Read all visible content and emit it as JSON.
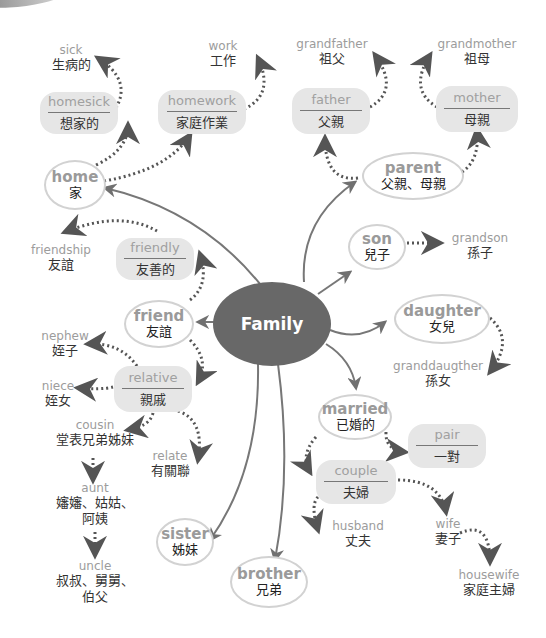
{
  "title": "Family",
  "center": {
    "label": "Family"
  },
  "colors": {
    "center_fill": "#686868",
    "box_fill": "#e6e6e6",
    "english_text": "#9c9c9c",
    "chinese_text": "#333333",
    "arrow": "#707070"
  },
  "nodes": {
    "home": {
      "en": "home",
      "zh": "家"
    },
    "homesick": {
      "en": "homesick",
      "zh": "想家的"
    },
    "sick": {
      "en": "sick",
      "zh": "生病的"
    },
    "homework": {
      "en": "homework",
      "zh": "家庭作業"
    },
    "work": {
      "en": "work",
      "zh": "工作"
    },
    "parent": {
      "en": "parent",
      "zh": "父親、母親"
    },
    "father": {
      "en": "father",
      "zh": "父親"
    },
    "grandfather": {
      "en": "grandfather",
      "zh": "祖父"
    },
    "mother": {
      "en": "mother",
      "zh": "母親"
    },
    "grandmother": {
      "en": "grandmother",
      "zh": "祖母"
    },
    "son": {
      "en": "son",
      "zh": "兒子"
    },
    "grandson": {
      "en": "grandson",
      "zh": "孫子"
    },
    "daughter": {
      "en": "daughter",
      "zh": "女兒"
    },
    "granddaughter": {
      "en": "granddaugther",
      "zh": "孫女"
    },
    "friend": {
      "en": "friend",
      "zh": "友誼"
    },
    "friendly": {
      "en": "friendly",
      "zh": "友善的"
    },
    "friendship": {
      "en": "friendship",
      "zh": "友誼"
    },
    "relative": {
      "en": "relative",
      "zh": "親戚"
    },
    "nephew": {
      "en": "nephew",
      "zh": "姪子"
    },
    "niece": {
      "en": "niece",
      "zh": "姪女"
    },
    "cousin": {
      "en": "cousin",
      "zh": "堂表兄弟姊妹"
    },
    "relate": {
      "en": "relate",
      "zh": "有關聯"
    },
    "aunt": {
      "en": "aunt",
      "zh1": "嬸嬸、姑姑、",
      "zh2": "阿姨"
    },
    "uncle": {
      "en": "uncle",
      "zh1": "叔叔、舅舅、",
      "zh2": "伯父"
    },
    "sister": {
      "en": "sister",
      "zh": "姊妹"
    },
    "brother": {
      "en": "brother",
      "zh": "兄弟"
    },
    "married": {
      "en": "married",
      "zh": "已婚的"
    },
    "pair": {
      "en": "pair",
      "zh": "一對"
    },
    "couple": {
      "en": "couple",
      "zh": "夫婦"
    },
    "husband": {
      "en": "husband",
      "zh": "丈夫"
    },
    "wife": {
      "en": "wife",
      "zh": "妻子"
    },
    "housewife": {
      "en": "housewife",
      "zh": "家庭主婦"
    }
  }
}
